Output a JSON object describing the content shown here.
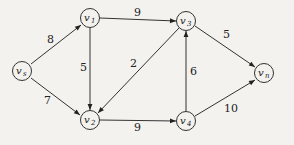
{
  "diagram": {
    "type": "directed-weighted-graph",
    "nodes": [
      {
        "id": "vs",
        "label": "v",
        "sub": "s",
        "x": 22,
        "y": 71
      },
      {
        "id": "v1",
        "label": "v",
        "sub": "1",
        "x": 90,
        "y": 18
      },
      {
        "id": "v2",
        "label": "v",
        "sub": "2",
        "x": 90,
        "y": 120
      },
      {
        "id": "v3",
        "label": "v",
        "sub": "3",
        "x": 186,
        "y": 21
      },
      {
        "id": "v4",
        "label": "v",
        "sub": "4",
        "x": 186,
        "y": 121
      },
      {
        "id": "vn",
        "label": "v",
        "sub": "n",
        "x": 264,
        "y": 73
      }
    ],
    "edges": [
      {
        "from": "vs",
        "to": "v1",
        "weight": "8"
      },
      {
        "from": "vs",
        "to": "v2",
        "weight": "7"
      },
      {
        "from": "v1",
        "to": "v3",
        "weight": "9"
      },
      {
        "from": "v1",
        "to": "v2",
        "weight": "5"
      },
      {
        "from": "v3",
        "to": "v2",
        "weight": "2"
      },
      {
        "from": "v2",
        "to": "v4",
        "weight": "9"
      },
      {
        "from": "v4",
        "to": "v3",
        "weight": "6"
      },
      {
        "from": "v3",
        "to": "vn",
        "weight": "5"
      },
      {
        "from": "v4",
        "to": "vn",
        "weight": "10"
      }
    ]
  },
  "colors": {
    "stroke": "#333333",
    "background": "#f3f2ef",
    "node_fill": "#f3f2ef"
  }
}
